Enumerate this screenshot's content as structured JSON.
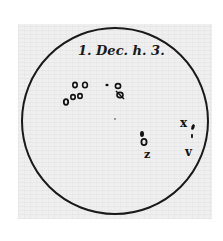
{
  "figure": {
    "caption": "1. Dec. h. 3.",
    "disc": {
      "cx": 115,
      "cy": 121,
      "r": 93,
      "stroke": "#1a1a1a"
    },
    "paper_color": "#efefef",
    "spots": [
      {
        "id": "spot-group-left-top",
        "x": 75,
        "y": 84
      },
      {
        "id": "spot-group-left-bottom",
        "x": 72,
        "y": 96
      },
      {
        "id": "spot-group-center",
        "x": 121,
        "y": 90
      },
      {
        "id": "spot-group-right-lower",
        "x": 145,
        "y": 142
      },
      {
        "id": "spot-group-right-edge",
        "x": 188,
        "y": 130
      }
    ],
    "labels": [
      {
        "text": "x",
        "x": 183,
        "y": 125
      },
      {
        "text": "z",
        "x": 148,
        "y": 157
      },
      {
        "text": "v",
        "x": 188,
        "y": 155
      }
    ]
  }
}
